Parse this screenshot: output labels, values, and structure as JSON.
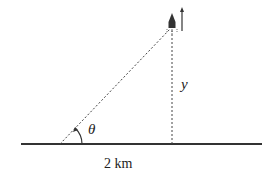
{
  "diagram": {
    "labels": {
      "angle": "θ",
      "height": "y",
      "distance": "2 km"
    },
    "elements": {
      "ground": "ground-line",
      "sightline": "dashed-hypotenuse",
      "altitude": "dashed-vertical",
      "object": "rocket-icon",
      "motion": "up-arrow-icon"
    },
    "colors": {
      "stroke": "#333333",
      "background": "#ffffff"
    }
  }
}
